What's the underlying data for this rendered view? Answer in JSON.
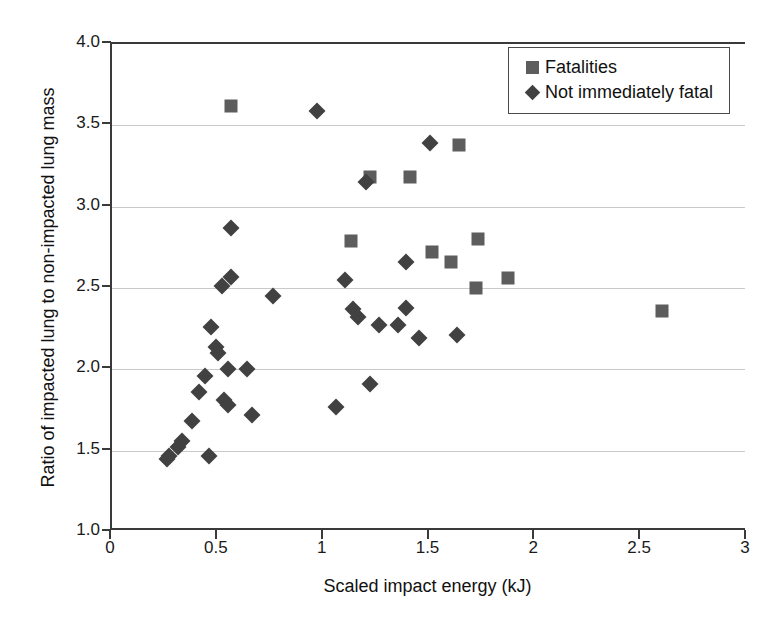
{
  "chart_data": {
    "type": "scatter",
    "title": "",
    "xlabel": "Scaled impact energy (kJ)",
    "ylabel": "Ratio of impacted lung to non-impacted lung mass",
    "xlim": [
      0,
      3
    ],
    "ylim": [
      1.0,
      4.0
    ],
    "xticks": [
      "0",
      "0.5",
      "1",
      "1.5",
      "2",
      "2.5",
      "3"
    ],
    "xtick_values": [
      0,
      0.5,
      1,
      1.5,
      2,
      2.5,
      3
    ],
    "yticks": [
      "1.0",
      "1.5",
      "2.0",
      "2.5",
      "3.0",
      "3.5",
      "4.0"
    ],
    "ytick_values": [
      1.0,
      1.5,
      2.0,
      2.5,
      3.0,
      3.5,
      4.0
    ],
    "grid": "horizontal",
    "legend_position": "top-right",
    "series": [
      {
        "name": "Fatalities",
        "marker": "square",
        "color": "#5d5d5d",
        "points": [
          [
            0.56,
            3.62
          ],
          [
            1.22,
            3.18
          ],
          [
            1.64,
            3.38
          ],
          [
            1.41,
            3.18
          ],
          [
            1.13,
            2.79
          ],
          [
            1.51,
            2.72
          ],
          [
            1.6,
            2.66
          ],
          [
            1.73,
            2.8
          ],
          [
            1.72,
            2.5
          ],
          [
            1.87,
            2.56
          ],
          [
            2.6,
            2.36
          ]
        ]
      },
      {
        "name": "Not immediately fatal",
        "marker": "diamond",
        "color": "#414141",
        "points": [
          [
            0.97,
            3.59
          ],
          [
            1.2,
            3.15
          ],
          [
            1.5,
            3.39
          ],
          [
            0.56,
            2.87
          ],
          [
            1.39,
            2.66
          ],
          [
            1.1,
            2.55
          ],
          [
            0.52,
            2.51
          ],
          [
            0.56,
            2.57
          ],
          [
            0.76,
            2.45
          ],
          [
            1.14,
            2.37
          ],
          [
            1.16,
            2.32
          ],
          [
            1.39,
            2.38
          ],
          [
            1.26,
            2.27
          ],
          [
            1.35,
            2.27
          ],
          [
            1.45,
            2.19
          ],
          [
            1.63,
            2.21
          ],
          [
            0.47,
            2.26
          ],
          [
            0.55,
            2.0
          ],
          [
            0.64,
            2.0
          ],
          [
            0.49,
            2.14
          ],
          [
            0.5,
            2.1
          ],
          [
            0.44,
            1.96
          ],
          [
            0.41,
            1.86
          ],
          [
            0.53,
            1.81
          ],
          [
            0.55,
            1.78
          ],
          [
            0.66,
            1.72
          ],
          [
            0.38,
            1.68
          ],
          [
            0.33,
            1.56
          ],
          [
            0.31,
            1.52
          ],
          [
            0.27,
            1.47
          ],
          [
            0.26,
            1.45
          ],
          [
            0.46,
            1.47
          ],
          [
            1.06,
            1.77
          ],
          [
            1.22,
            1.91
          ]
        ]
      }
    ]
  },
  "legend": {
    "items": [
      {
        "label": "Fatalities",
        "marker": "square"
      },
      {
        "label": "Not immediately fatal",
        "marker": "diamond"
      }
    ]
  }
}
